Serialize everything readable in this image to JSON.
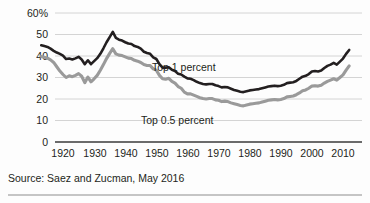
{
  "chart_data": {
    "type": "line",
    "title": "",
    "subtitle": "",
    "xlabel": "",
    "ylabel": "",
    "ylim": [
      0,
      60
    ],
    "xlim": [
      1913,
      2012
    ],
    "grid": true,
    "legend_position": "inline-annotation",
    "y_ticks": [
      "60%",
      "50",
      "40",
      "30",
      "20",
      "10",
      "0"
    ],
    "y_tick_values": [
      60,
      50,
      40,
      30,
      20,
      10,
      0
    ],
    "x_ticks": [
      "1920",
      "1930",
      "1940",
      "1950",
      "1960",
      "1970",
      "1980",
      "1990",
      "2000",
      "2010"
    ],
    "x_tick_values": [
      1920,
      1930,
      1940,
      1950,
      1960,
      1970,
      1980,
      1990,
      2000,
      2010
    ],
    "x": [
      1913,
      1914,
      1915,
      1916,
      1917,
      1918,
      1919,
      1920,
      1921,
      1922,
      1923,
      1924,
      1925,
      1926,
      1927,
      1928,
      1929,
      1930,
      1931,
      1932,
      1933,
      1934,
      1935,
      1936,
      1937,
      1938,
      1939,
      1940,
      1941,
      1942,
      1943,
      1944,
      1945,
      1946,
      1947,
      1948,
      1949,
      1950,
      1951,
      1952,
      1953,
      1954,
      1955,
      1956,
      1957,
      1958,
      1959,
      1960,
      1961,
      1962,
      1963,
      1964,
      1965,
      1966,
      1967,
      1968,
      1969,
      1970,
      1971,
      1972,
      1973,
      1974,
      1975,
      1976,
      1977,
      1978,
      1979,
      1980,
      1981,
      1982,
      1983,
      1984,
      1985,
      1986,
      1987,
      1988,
      1989,
      1990,
      1991,
      1992,
      1993,
      1994,
      1995,
      1996,
      1997,
      1998,
      1999,
      2000,
      2001,
      2002,
      2003,
      2004,
      2005,
      2006,
      2007,
      2008,
      2009,
      2010,
      2011,
      2012
    ],
    "series": [
      {
        "name": "Top 1 percent",
        "color": "#231f20",
        "values": [
          45.0,
          44.6,
          44.2,
          43.4,
          42.4,
          41.6,
          41.0,
          40.2,
          38.6,
          38.8,
          38.4,
          38.9,
          39.6,
          38.4,
          36.2,
          38.0,
          36.2,
          37.6,
          39.0,
          41.0,
          43.6,
          46.4,
          48.8,
          51.2,
          48.4,
          47.6,
          47.2,
          46.4,
          45.8,
          45.6,
          44.6,
          44.2,
          43.4,
          42.0,
          41.4,
          41.0,
          39.4,
          38.6,
          36.2,
          34.6,
          34.6,
          34.8,
          33.6,
          33.0,
          31.8,
          31.4,
          30.4,
          29.6,
          29.4,
          28.8,
          28.0,
          27.4,
          27.0,
          26.8,
          27.0,
          27.0,
          26.4,
          26.0,
          25.4,
          25.6,
          25.4,
          24.8,
          24.2,
          23.8,
          23.4,
          23.2,
          23.6,
          24.0,
          24.2,
          24.4,
          24.6,
          25.0,
          25.4,
          25.8,
          26.0,
          26.2,
          26.0,
          26.2,
          26.6,
          27.4,
          27.6,
          27.8,
          28.4,
          29.4,
          30.4,
          30.8,
          31.6,
          32.8,
          33.0,
          32.8,
          33.2,
          34.4,
          35.4,
          36.0,
          36.8,
          36.0,
          37.4,
          38.8,
          41.0,
          42.8
        ],
        "end_value": 42.8,
        "peak_value": 51.2,
        "peak_year": 1936,
        "min_value": 23.2,
        "min_year": 1978
      },
      {
        "name": "Top 0.5 percent",
        "color": "#9a9a9a",
        "values": [
          39.8,
          39.4,
          39.0,
          38.2,
          37.0,
          35.0,
          33.0,
          31.4,
          30.0,
          30.8,
          30.4,
          31.0,
          31.8,
          30.6,
          27.6,
          30.2,
          28.0,
          29.4,
          31.0,
          33.4,
          36.0,
          38.8,
          41.2,
          43.4,
          41.0,
          40.4,
          40.2,
          39.6,
          39.0,
          38.8,
          38.0,
          37.6,
          37.0,
          36.0,
          35.6,
          35.6,
          34.0,
          33.4,
          31.0,
          29.4,
          29.2,
          29.6,
          28.2,
          27.4,
          25.8,
          25.0,
          23.2,
          22.4,
          22.4,
          21.8,
          21.2,
          20.6,
          20.2,
          20.0,
          20.2,
          20.2,
          19.6,
          19.4,
          18.8,
          19.0,
          18.8,
          18.2,
          17.8,
          17.4,
          17.0,
          16.8,
          17.2,
          17.6,
          17.8,
          18.0,
          18.2,
          18.6,
          19.0,
          19.4,
          19.6,
          19.8,
          19.6,
          19.8,
          20.2,
          21.0,
          21.2,
          21.4,
          22.0,
          22.8,
          23.8,
          24.2,
          25.0,
          26.0,
          26.2,
          26.0,
          26.4,
          27.4,
          28.2,
          28.8,
          29.4,
          28.8,
          30.0,
          31.2,
          33.4,
          35.4
        ],
        "end_value": 35.4,
        "peak_value": 43.4,
        "peak_year": 1936,
        "min_value": 16.8,
        "min_year": 1978
      }
    ],
    "annotations": [
      {
        "text": "Top 1 percent",
        "x_px": 152,
        "y_px": 71
      },
      {
        "text": "Top 0.5 percent",
        "x_px": 141,
        "y_px": 124
      }
    ],
    "source": "Source: Saez and Zucman, May 2016"
  }
}
